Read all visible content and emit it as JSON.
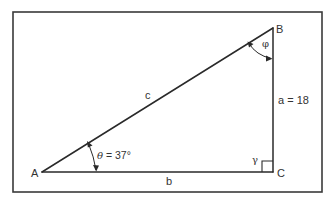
{
  "diagram": {
    "type": "right-triangle",
    "colors": {
      "line": "#2a2a2a",
      "text": "#333333",
      "frame": "#3a3a3a",
      "background": "#ffffff"
    },
    "vertices": {
      "A": {
        "label": "A"
      },
      "B": {
        "label": "B"
      },
      "C": {
        "label": "C"
      }
    },
    "sides": {
      "a": {
        "label": "a = 18"
      },
      "b": {
        "label": "b"
      },
      "c": {
        "label": "c"
      }
    },
    "angles": {
      "theta": {
        "symbol": "θ",
        "value_label": " = 37°"
      },
      "phi": {
        "symbol": "φ"
      },
      "gamma": {
        "symbol": "γ",
        "note": "right angle"
      }
    }
  }
}
